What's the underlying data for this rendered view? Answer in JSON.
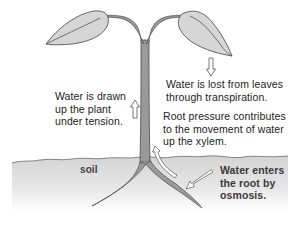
{
  "diagram": {
    "labels": {
      "transpiration": "Water is lost from leaves\nthrough transpiration.",
      "tension": "Water is drawn\nup the plant\nunder tension.",
      "root_pressure": "Root pressure contributes\nto the movement of water\nup the xylem.",
      "osmosis": "Water enters\nthe root by\nosmosis.",
      "soil": "soil"
    },
    "arrows": [
      {
        "name": "transpiration-arrow",
        "direction": "down"
      },
      {
        "name": "tension-arrow",
        "direction": "up"
      },
      {
        "name": "root-pressure-arrow",
        "direction": "up"
      },
      {
        "name": "osmosis-arrow",
        "direction": "down-left"
      }
    ],
    "colors": {
      "leaf_fill": "#d6d6d6",
      "leaf_stroke": "#555555",
      "stem_fill": "#9a9a9a",
      "stem_stroke": "#4a4a4a",
      "soil_top": "#d9d9d9",
      "soil_bottom": "#ffffff",
      "text": "#222222"
    }
  }
}
